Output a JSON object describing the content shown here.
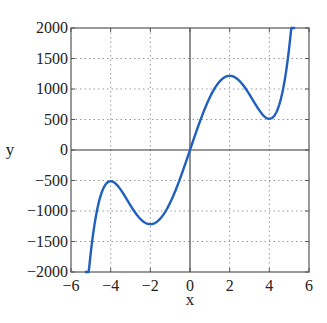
{
  "chart_data": {
    "type": "line",
    "title": "",
    "xlabel": "x",
    "ylabel": "y",
    "xlim": [
      -6,
      6
    ],
    "ylim": [
      -2000,
      2000
    ],
    "xticks": [
      -6,
      -4,
      -2,
      0,
      2,
      4,
      6
    ],
    "yticks": [
      -2000,
      -1500,
      -1000,
      -500,
      0,
      500,
      1000,
      1500,
      2000
    ],
    "xtick_labels": [
      "−6",
      "−4",
      "−2",
      "0",
      "2",
      "4",
      "6"
    ],
    "ytick_labels": [
      "−2000",
      "−1500",
      "−1000",
      "−500",
      "0",
      "500",
      "1000",
      "1500",
      "2000"
    ],
    "grid": true,
    "grid_style": "dotted",
    "zero_lines": true,
    "legend": null,
    "series": [
      {
        "name": "y = 3x^5 - 100x^3 + 960x",
        "color": "#1f5fbf",
        "x": [
          -5.3,
          -5.0,
          -4.75,
          -4.5,
          -4.25,
          -4.0,
          -3.75,
          -3.5,
          -3.25,
          -3.0,
          -2.75,
          -2.5,
          -2.25,
          -2.0,
          -1.75,
          -1.5,
          -1.25,
          -1.0,
          -0.75,
          -0.5,
          -0.25,
          0,
          0.25,
          0.5,
          0.75,
          1.0,
          1.25,
          1.5,
          1.75,
          2.0,
          2.25,
          2.5,
          2.75,
          3.0,
          3.25,
          3.5,
          3.75,
          4.0,
          4.25,
          4.5,
          4.75,
          5.0,
          5.3
        ],
        "y": [
          -2080,
          -1425,
          -996,
          -722,
          -565,
          -512,
          -546,
          -651,
          -801,
          -981,
          -1106,
          -1191,
          -1230,
          -1216,
          -1147,
          -1019,
          -837,
          -863,
          -585,
          -468,
          -238,
          0,
          238,
          468,
          585,
          863,
          837,
          1019,
          1147,
          1216,
          1230,
          1191,
          1106,
          981,
          801,
          651,
          546,
          512,
          565,
          722,
          996,
          1425,
          2080
        ]
      }
    ],
    "extrema": {
      "local_max": [
        [
          -4,
          -512
        ],
        [
          2,
          1216
        ]
      ],
      "local_min": [
        [
          -2,
          -1216
        ],
        [
          4,
          512
        ]
      ]
    }
  }
}
